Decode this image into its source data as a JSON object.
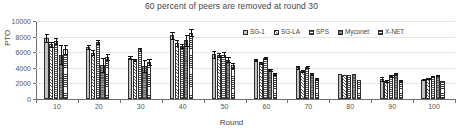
{
  "chart_data": {
    "type": "bar",
    "title": "60 percent of peers are removed at round 30",
    "xlabel": "Round",
    "ylabel": "PTO",
    "ylim": [
      0,
      10000
    ],
    "yticks": [
      0,
      2000,
      4000,
      6000,
      8000,
      10000
    ],
    "ytick_labels": [
      "0",
      "2000",
      "4000",
      "6000",
      "8000",
      "10000"
    ],
    "grid": true,
    "legend_position": "top-right",
    "categories": [
      "10",
      "20",
      "30",
      "40",
      "50",
      "60",
      "70",
      "80",
      "90",
      "100"
    ],
    "series": [
      {
        "name": "SG-1",
        "color": "#c3c3c3",
        "pattern": "solid-light-gray",
        "values": [
          7850,
          6650,
          5300,
          8150,
          5750,
          5000,
          4050,
          3150,
          2550,
          2500
        ],
        "errors": [
          500,
          300,
          200,
          500,
          450,
          150,
          150,
          60,
          250,
          100
        ]
      },
      {
        "name": "SG-LA",
        "color": "#efefef",
        "pattern": "diagonal-hatch",
        "values": [
          7000,
          5950,
          5000,
          7200,
          5650,
          4600,
          3550,
          3050,
          2300,
          2650
        ],
        "errors": [
          350,
          300,
          150,
          350,
          300,
          120,
          120,
          60,
          150,
          80
        ]
      },
      {
        "name": "SPS",
        "color": "#ffffff",
        "pattern": "grid-hatch",
        "values": [
          7400,
          7300,
          6350,
          6800,
          5700,
          5300,
          4050,
          3050,
          3000,
          2900
        ],
        "errors": [
          400,
          250,
          200,
          300,
          300,
          130,
          130,
          60,
          130,
          80
        ]
      },
      {
        "name": "Myconet",
        "color": "#8b8b8b",
        "pattern": "dark-horizontal-dotted",
        "values": [
          5700,
          4400,
          4200,
          7550,
          5050,
          3750,
          3250,
          3200,
          3200,
          3000
        ],
        "errors": [
          1200,
          900,
          800,
          700,
          350,
          120,
          120,
          60,
          120,
          80
        ]
      },
      {
        "name": "X-NET",
        "color": "#ffffff",
        "pattern": "horizontal-line-hatch",
        "values": [
          6350,
          5400,
          4750,
          8500,
          4300,
          3200,
          2600,
          2450,
          2350,
          2250
        ],
        "errors": [
          600,
          350,
          350,
          450,
          300,
          110,
          110,
          60,
          110,
          70
        ]
      }
    ]
  }
}
